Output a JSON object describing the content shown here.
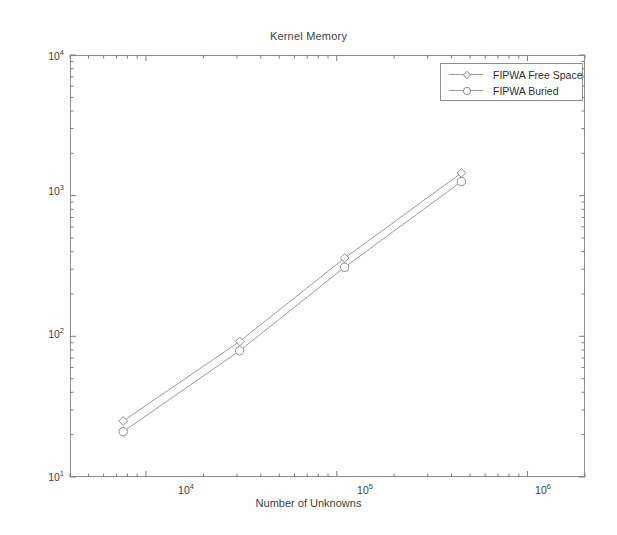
{
  "chart_data": {
    "type": "line",
    "title": "Kernel Memory",
    "xlabel": "Number of Unknowns",
    "ylabel": "Memory (MB)",
    "xscale": "log",
    "yscale": "log",
    "xlim": [
      4000,
      2000000
    ],
    "ylim": [
      10,
      10000
    ],
    "grid": false,
    "legend_position": "top-right",
    "x_tick_labels": [
      "10",
      "10",
      "10"
    ],
    "x_tick_exponents": [
      "4",
      "5",
      "6"
    ],
    "x_tick_values": [
      10000,
      100000,
      1000000
    ],
    "y_tick_labels": [
      "10",
      "10",
      "10",
      "10"
    ],
    "y_tick_exponents": [
      "1",
      "2",
      "3",
      "4"
    ],
    "y_tick_values": [
      10,
      100,
      1000,
      10000
    ],
    "x": [
      7600,
      31000,
      110000,
      450000
    ],
    "series": [
      {
        "name": "FIPWA Free Space",
        "marker": "diamond",
        "color": "#8d8d8d",
        "values": [
          25,
          92,
          360,
          1450
        ]
      },
      {
        "name": "FIPWA Buried",
        "marker": "circle",
        "color": "#8d8d8d",
        "values": [
          21,
          79,
          310,
          1260
        ]
      }
    ]
  },
  "legend": {
    "entries": [
      {
        "label": "FIPWA Free Space"
      },
      {
        "label": "FIPWA Buried"
      }
    ]
  }
}
